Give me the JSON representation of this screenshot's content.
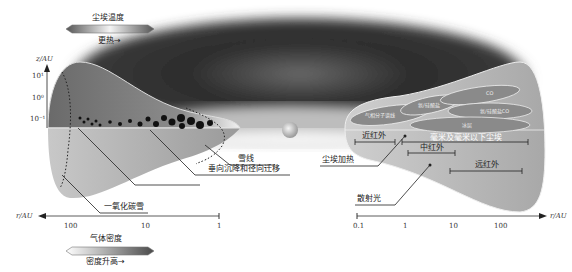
{
  "top_legend": {
    "title": "尘埃温度",
    "caption": "更热→",
    "gradient": [
      "#555555",
      "#f0f0f0",
      "#555555"
    ]
  },
  "bottom_legend": {
    "title": "气体密度",
    "caption": "密度升高→",
    "gradient": [
      "#ffffff",
      "#555555"
    ]
  },
  "left_panel": {
    "z_axis": {
      "label": "z/AU",
      "ticks": [
        "10¹",
        "10⁰",
        "10⁻¹"
      ]
    },
    "r_axis": {
      "label": "r/AU",
      "ticks": [
        "100",
        "10",
        "1"
      ],
      "direction": "leftward"
    },
    "annotations": {
      "snowline": "雪线",
      "settling": "垂向沉降和径向迁移",
      "co_snow": "一氧化碳雪"
    }
  },
  "right_panel": {
    "r_axis": {
      "label": "r/AU",
      "ticks": [
        "0.1",
        "1",
        "10",
        "100"
      ],
      "direction": "rightward"
    },
    "bands": {
      "near_ir": "近红外",
      "mm_dust": "毫米及毫米以下尘埃",
      "mid_ir": "中红外",
      "far_ir": "远红外"
    },
    "annotations": {
      "dust_heating": "尘埃加热",
      "scattered_light": "散射光"
    },
    "ellipse_labels": [
      "气相分子谱线",
      "氨/硅酸盐",
      "CO",
      "氨/硅酸盐CO",
      "冰层"
    ]
  },
  "colors": {
    "disk_dark": "#6e6e6e",
    "disk_mid": "#9a9a9a",
    "disk_light": "#c4c4c4",
    "cloud": "#2a2a2a"
  }
}
